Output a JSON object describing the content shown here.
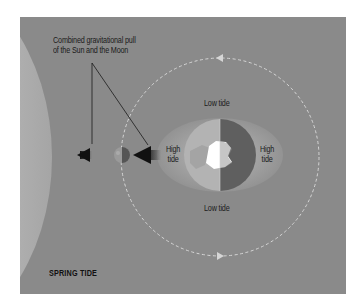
{
  "diagram": {
    "title": "SPRING TIDE",
    "callout": {
      "line1": "Combined gravitational pull",
      "line2": "of the Sun and the Moon"
    },
    "labels": {
      "low_tide_top": "Low tide",
      "low_tide_bottom": "Low tide",
      "high_tide_left_1": "High",
      "high_tide_left_2": "tide",
      "high_tide_right_1": "High",
      "high_tide_right_2": "tide"
    },
    "elements": [
      "sun",
      "moon",
      "earth",
      "tidal-bulge",
      "moon-orbit",
      "pull-arrow-sun",
      "pull-arrow-moon"
    ],
    "colors": {
      "background": "#8a8a8a",
      "sun": "#b4b4b4",
      "bulge": "#9d9d9d",
      "earth_day": "#b0b0b0",
      "earth_night": "#5e5e5e",
      "orbit": "#d8d8d8",
      "arrow": "#111111"
    }
  }
}
